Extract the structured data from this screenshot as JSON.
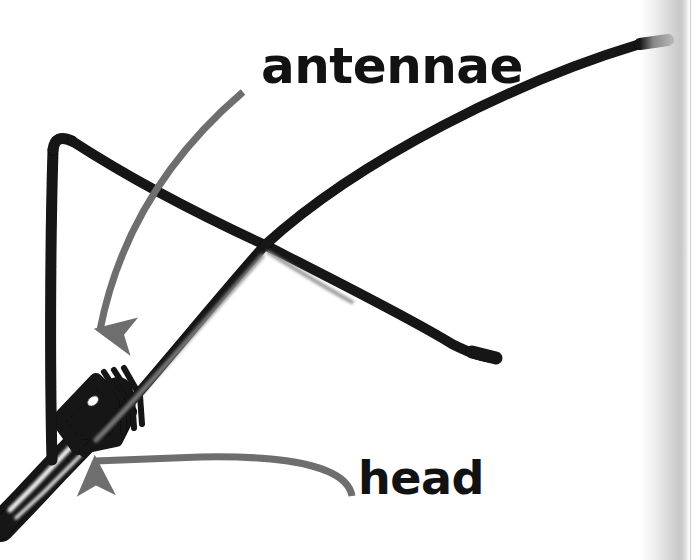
{
  "figure": {
    "kind": "photograph-diagram",
    "background_color": "#ffffff",
    "ink_color": "#121212",
    "arrow_color": "#6e6e6e",
    "gutter_color": "#c4c4c4"
  },
  "labels": [
    {
      "id": "antennae",
      "text": "antennae",
      "color": "#121212",
      "x": 261,
      "y": 41,
      "font_size": 50
    },
    {
      "id": "head",
      "text": "head",
      "color": "#121212",
      "x": 358,
      "y": 455,
      "font_size": 46
    }
  ],
  "annotations": [
    {
      "id": "antennae-arrow",
      "points_to": "antennae",
      "color": "#6e6e6e",
      "start": [
        243,
        92
      ],
      "end": [
        97,
        365
      ],
      "direction": "down-left"
    },
    {
      "id": "head-arrow",
      "points_to": "head",
      "color": "#6e6e6e",
      "start": [
        352,
        496
      ],
      "end": [
        68,
        462
      ],
      "direction": "left"
    }
  ],
  "anatomy": {
    "upper_antenna_tip": [
      668,
      40
    ],
    "lower_antenna_tip": [
      496,
      358
    ],
    "antennae_crossing_point": [
      265,
      245
    ],
    "left_antenna_bend": [
      55,
      136
    ],
    "head_position": [
      70,
      460
    ]
  }
}
